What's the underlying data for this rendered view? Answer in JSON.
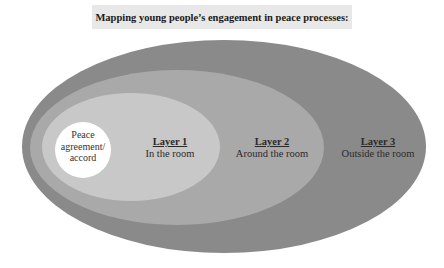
{
  "title": "Mapping young people’s engagement in peace processes:",
  "colors": {
    "title_bg": "#e8e8e8",
    "layer3": "#8a8a8a",
    "layer2": "#a9a9a9",
    "layer1": "#c8c8c8",
    "core": "#ffffff"
  },
  "core": {
    "line1": "Peace",
    "line2": "agreement/",
    "line3": "accord"
  },
  "layers": [
    {
      "heading": "Layer 1",
      "subtitle": "In the room"
    },
    {
      "heading": "Layer 2",
      "subtitle": "Around the room"
    },
    {
      "heading": "Layer 3",
      "subtitle": "Outside the room"
    }
  ]
}
